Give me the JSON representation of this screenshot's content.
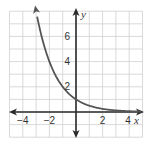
{
  "chart_data": {
    "type": "line",
    "title": "",
    "xlabel": "x",
    "ylabel": "y",
    "xlim": [
      -5,
      5
    ],
    "ylim": [
      -2,
      8
    ],
    "grid": true,
    "x_ticks": [
      "−4",
      "−2",
      "2",
      "4"
    ],
    "x_tick_values": [
      -4,
      -2,
      2,
      4
    ],
    "y_ticks": [
      "2",
      "4",
      "6"
    ],
    "y_tick_values": [
      2,
      4,
      6
    ],
    "series": [
      {
        "name": "y = (1/2)^x",
        "x": [
          -3,
          -2,
          -1,
          0,
          1,
          2,
          3,
          4,
          5
        ],
        "values": [
          8,
          4,
          2,
          1,
          0.5,
          0.25,
          0.125,
          0.0625,
          0.03125
        ]
      }
    ],
    "legend": "none"
  },
  "colors": {
    "grid": "#cfcfcf",
    "axis": "#2b2b2b",
    "curve": "#555555"
  }
}
